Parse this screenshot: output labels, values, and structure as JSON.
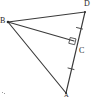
{
  "figure": {
    "background_color": "#ffffff",
    "line_color": "#3a3a3a",
    "label_color": "#1d1d1d",
    "mark_color": "#4a4a4a"
  },
  "points": {
    "D": {
      "label": "D",
      "x": 85,
      "y": 12
    },
    "B": {
      "label": "B",
      "x": 8,
      "y": 22
    },
    "C": {
      "label": "C",
      "x": 71,
      "y": 45
    },
    "A": {
      "label": "A",
      "x": 66,
      "y": 93
    }
  },
  "segments": [
    {
      "name": "BD",
      "from": "B",
      "to": "D"
    },
    {
      "name": "BA",
      "from": "B",
      "to": "A"
    },
    {
      "name": "BC",
      "from": "B",
      "to": "C"
    },
    {
      "name": "DA",
      "from": "D",
      "to": "A"
    }
  ],
  "marks": {
    "right_angle": {
      "at": "C",
      "between": [
        "BC",
        "DA"
      ],
      "symbol": "square"
    },
    "congruence_ticks": [
      {
        "on": "DC",
        "count": 1
      },
      {
        "on": "CA",
        "count": 1
      }
    ]
  }
}
